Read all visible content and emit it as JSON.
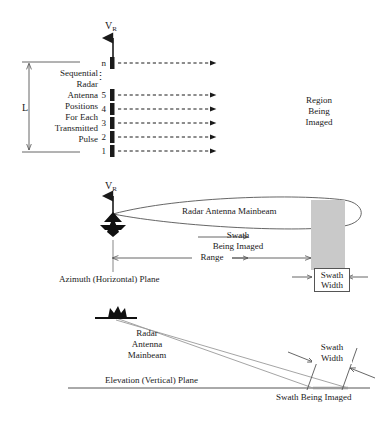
{
  "diagram": {
    "colors": {
      "line": "#555555",
      "ink": "#1a1a1a",
      "shade": "#c9c9c9",
      "tick": "#1a1a1a"
    }
  },
  "panel_top": {
    "velocity_label": "V",
    "velocity_subscript": "R",
    "aperture_label": "L",
    "positions_caption": "Sequential\nRadar\nAntenna\nPositions\nFor Each\nTransmitted\nPulse",
    "region_caption": "Region\nBeing\nImaged",
    "pulse_labels": [
      "n",
      "5",
      "4",
      "3",
      "2",
      "1"
    ],
    "ellipsis": "⋮"
  },
  "panel_middle": {
    "velocity_label": "V",
    "velocity_subscript": "R",
    "mainbeam_label": "Radar Antenna Mainbeam",
    "swath_label": "Swath\nBeing Imaged",
    "range_label": "Range",
    "plane_label": "Azimuth (Horizontal) Plane",
    "swath_width_label": "Swath\nWidth"
  },
  "panel_bottom": {
    "mainbeam_label": "Radar\nAntenna\nMainbeam",
    "plane_label": "Elevation (Vertical) Plane",
    "swath_width_label": "Swath\nWidth",
    "swath_ground_label": "Swath Being Imaged"
  }
}
